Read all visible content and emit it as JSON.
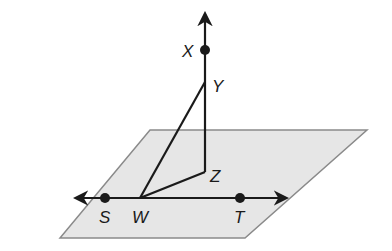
{
  "diagram": {
    "plane": {
      "points": [
        [
          150,
          130
        ],
        [
          367,
          130
        ],
        [
          245,
          238
        ],
        [
          60,
          238
        ]
      ],
      "fill": "#e6e6e6",
      "stroke": "#8a8a8a"
    },
    "line_st": {
      "x1": 76,
      "y1": 198,
      "x2": 286,
      "y2": 198
    },
    "vertical_line": {
      "x": 205,
      "y_top": 14,
      "y_bottom": 172
    },
    "points": {
      "X": {
        "label": "X",
        "x": 205,
        "y": 50,
        "lx": 182,
        "ly": 57
      },
      "Y": {
        "label": "Y",
        "x": 205,
        "y": 82,
        "lx": 212,
        "ly": 92
      },
      "Z": {
        "label": "Z",
        "x": 205,
        "y": 172,
        "lx": 210,
        "ly": 182
      },
      "S": {
        "label": "S",
        "x": 105,
        "y": 198,
        "lx": 99,
        "ly": 223
      },
      "W": {
        "label": "W",
        "x": 140,
        "y": 198,
        "lx": 132,
        "ly": 223
      },
      "T": {
        "label": "T",
        "x": 240,
        "y": 198,
        "lx": 234,
        "ly": 223
      }
    },
    "segments": [
      {
        "from": "W",
        "to": "Y"
      },
      {
        "from": "W",
        "to": "Z"
      }
    ],
    "colors": {
      "line": "#1a1a1a",
      "plane_fill": "#e6e6e6",
      "plane_edge": "#8a8a8a"
    }
  }
}
